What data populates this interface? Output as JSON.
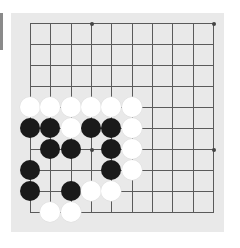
{
  "board": {
    "size_lines": 10,
    "grid_origin_px": [
      30,
      23
    ],
    "spacing_px": [
      20.33,
      21
    ],
    "background": "#e9e9e9",
    "line_color": "#5a5a5a",
    "star_points": [
      [
        3,
        0
      ],
      [
        9,
        0
      ],
      [
        3,
        6
      ],
      [
        9,
        6
      ]
    ],
    "stones": [
      {
        "col": 0,
        "row": 4,
        "color": "white"
      },
      {
        "col": 1,
        "row": 4,
        "color": "white"
      },
      {
        "col": 2,
        "row": 4,
        "color": "white"
      },
      {
        "col": 3,
        "row": 4,
        "color": "white"
      },
      {
        "col": 4,
        "row": 4,
        "color": "white"
      },
      {
        "col": 5,
        "row": 4,
        "color": "white"
      },
      {
        "col": 0,
        "row": 5,
        "color": "black"
      },
      {
        "col": 1,
        "row": 5,
        "color": "black"
      },
      {
        "col": 2,
        "row": 5,
        "color": "white"
      },
      {
        "col": 3,
        "row": 5,
        "color": "black"
      },
      {
        "col": 4,
        "row": 5,
        "color": "black"
      },
      {
        "col": 5,
        "row": 5,
        "color": "white"
      },
      {
        "col": 1,
        "row": 6,
        "color": "black"
      },
      {
        "col": 2,
        "row": 6,
        "color": "black"
      },
      {
        "col": 4,
        "row": 6,
        "color": "black"
      },
      {
        "col": 5,
        "row": 6,
        "color": "white"
      },
      {
        "col": 0,
        "row": 7,
        "color": "black"
      },
      {
        "col": 4,
        "row": 7,
        "color": "black"
      },
      {
        "col": 5,
        "row": 7,
        "color": "white"
      },
      {
        "col": 0,
        "row": 8,
        "color": "black"
      },
      {
        "col": 2,
        "row": 8,
        "color": "black"
      },
      {
        "col": 3,
        "row": 8,
        "color": "white"
      },
      {
        "col": 4,
        "row": 8,
        "color": "white"
      },
      {
        "col": 1,
        "row": 9,
        "color": "white"
      },
      {
        "col": 2,
        "row": 9,
        "color": "white"
      }
    ]
  }
}
